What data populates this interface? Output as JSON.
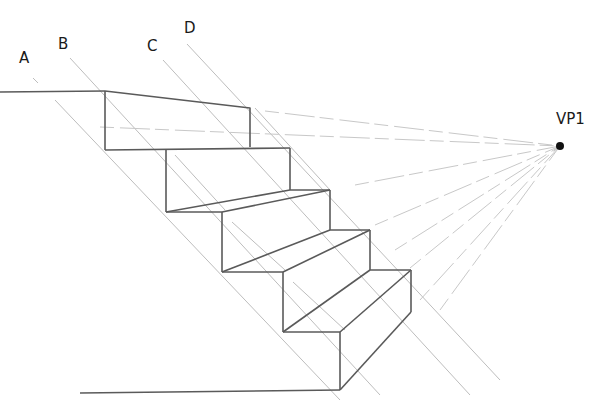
{
  "diagram": {
    "type": "one-point perspective staircase construction",
    "labels": {
      "a": "A",
      "b": "B",
      "c": "C",
      "d": "D",
      "vanishing_point": "VP1"
    },
    "vanishing_point": {
      "x": 560,
      "y": 146
    },
    "step_count": 4,
    "colors": {
      "edge": "#5a5a5a",
      "guide": "#bdbdbd",
      "vp_dot": "#111111"
    }
  }
}
